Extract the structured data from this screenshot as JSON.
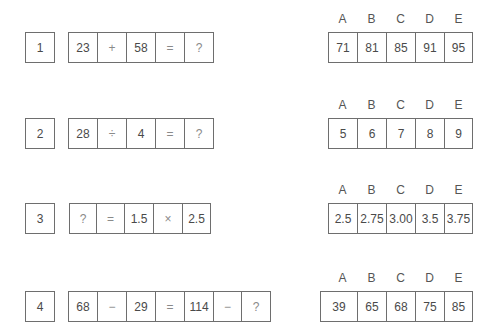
{
  "questions": [
    {
      "number": "1",
      "equation": [
        "23",
        "+",
        "58",
        "=",
        "?"
      ],
      "option_labels": [
        "A",
        "B",
        "C",
        "D",
        "E"
      ],
      "options": [
        "71",
        "81",
        "85",
        "91",
        "95"
      ]
    },
    {
      "number": "2",
      "equation": [
        "28",
        "÷",
        "4",
        "=",
        "?"
      ],
      "option_labels": [
        "A",
        "B",
        "C",
        "D",
        "E"
      ],
      "options": [
        "5",
        "6",
        "7",
        "8",
        "9"
      ]
    },
    {
      "number": "3",
      "equation": [
        "?",
        "=",
        "1.5",
        "×",
        "2.5"
      ],
      "option_labels": [
        "A",
        "B",
        "C",
        "D",
        "E"
      ],
      "options": [
        "2.5",
        "2.75",
        "3.00",
        "3.5",
        "3.75"
      ]
    },
    {
      "number": "4",
      "equation": [
        "68",
        "−",
        "29",
        "=",
        "114",
        "−",
        "?"
      ],
      "option_labels": [
        "A",
        "B",
        "C",
        "D",
        "E"
      ],
      "options": [
        "39",
        "65",
        "68",
        "75",
        "85"
      ]
    }
  ]
}
